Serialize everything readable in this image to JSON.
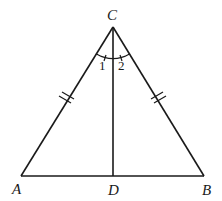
{
  "diagram": {
    "type": "isosceles-triangle-with-angle-bisector",
    "vertices": {
      "A": {
        "label": "A",
        "x": 21,
        "y": 176
      },
      "B": {
        "label": "B",
        "x": 204,
        "y": 176
      },
      "C": {
        "label": "C",
        "x": 113,
        "y": 27
      },
      "D": {
        "label": "D",
        "x": 113,
        "y": 176
      }
    },
    "segments": [
      "AB",
      "AC",
      "BC",
      "CD"
    ],
    "equal_marks": {
      "AC": "double-tick",
      "BC": "double-tick"
    },
    "angles": [
      {
        "label": "1",
        "between": [
          "CA",
          "CD"
        ]
      },
      {
        "label": "2",
        "between": [
          "CD",
          "CB"
        ]
      }
    ]
  }
}
